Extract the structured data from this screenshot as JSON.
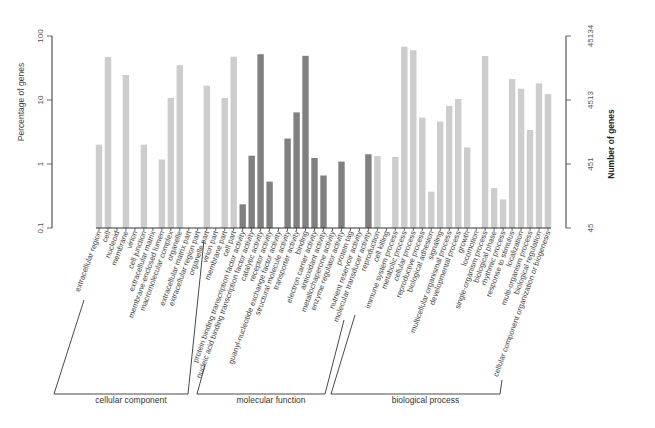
{
  "chart_data": {
    "type": "bar",
    "title": "",
    "ylabel": "Percentage of genes",
    "ylabel_right": "Number of genes",
    "yscale": "log",
    "ylim": [
      0.1,
      100
    ],
    "yticks_left": [
      "0.1",
      "1",
      "10",
      "100"
    ],
    "yticks_right": [
      "45",
      "451",
      "4513",
      "45134"
    ],
    "grid": false,
    "colors": {
      "light": "#cdcdcd",
      "dark": "#808080"
    },
    "groups": [
      {
        "name": "cellular component",
        "color": "light",
        "categories": [
          "extracellular region",
          "cell",
          "nucleoid",
          "membrane",
          "virion",
          "cell junction",
          "extracellular matrix",
          "membrane-enclosed lumen",
          "macromolecular complex",
          "organelle",
          "extracellular matrix part",
          "extracellular region part",
          "organelle part",
          "virion part",
          "membrane part",
          "cell part"
        ],
        "values": [
          2.0,
          47,
          null,
          24.6,
          null,
          2.0,
          null,
          1.18,
          10.8,
          35,
          null,
          null,
          16.7,
          null,
          10.8,
          47.5
        ]
      },
      {
        "name": "molecular function",
        "color": "dark",
        "categories": [
          "protein binding transcription factor activity",
          "nucleic acid binding transcription factor activity",
          "catalytic activity",
          "receptor activity",
          "guanyl-nucleotide exchange factor activity",
          "structural molecule activity",
          "transporter activity",
          "binding",
          "electron carrier activity",
          "antioxidant activity",
          "metallochaperone activity",
          "enzyme regulator activity",
          "protein tag",
          "nutrient reservoir activity",
          "molecular transducer activity"
        ],
        "values": [
          0.235,
          1.35,
          52,
          0.53,
          null,
          2.5,
          6.4,
          49,
          1.24,
          0.66,
          null,
          1.09,
          null,
          null,
          1.42
        ]
      },
      {
        "name": "biological process",
        "color": "light",
        "categories": [
          "reproduction",
          "cell killing",
          "immune system process",
          "metabolic process",
          "cellular process",
          "reproductive process",
          "biological adhesion",
          "signaling",
          "multicellular organismal process",
          "developmental process",
          "growth",
          "locomotion",
          "single-organism process",
          "biological phase",
          "rhythmic process",
          "response to stimulus",
          "localization",
          "multi-organism process",
          "biological regulation",
          "cellular component organization or biogenesis"
        ],
        "values": [
          1.33,
          null,
          1.29,
          68,
          60,
          5.3,
          0.37,
          4.6,
          8.1,
          10.4,
          1.82,
          null,
          48.7,
          0.42,
          0.28,
          21.3,
          15,
          3.4,
          18.2,
          12.4
        ]
      }
    ]
  }
}
